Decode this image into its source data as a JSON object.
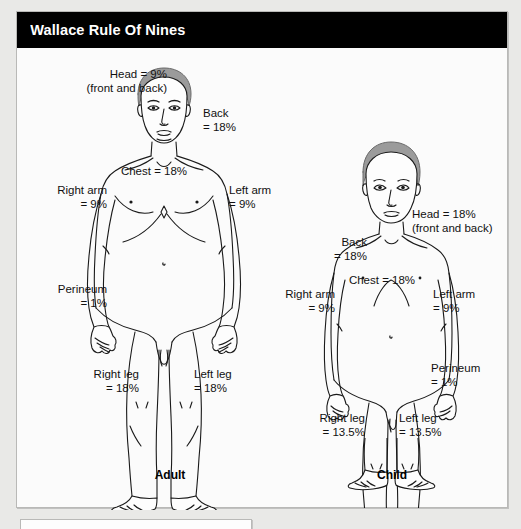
{
  "header": {
    "title": "Wallace Rule Of Nines"
  },
  "figures": {
    "adult": {
      "caption": "Adult",
      "labels": {
        "head": "Head = 9%\n(front and back)",
        "back": "Back\n= 18%",
        "chest": "Chest = 18%",
        "right_arm": "Right arm\n= 9%",
        "left_arm": "Left arm\n= 9%",
        "perineum": "Perineum\n= 1%",
        "right_leg": "Right leg\n= 18%",
        "left_leg": "Left leg\n= 18%"
      }
    },
    "child": {
      "caption": "Child",
      "labels": {
        "head": "Head = 18%\n(front and back)",
        "back": "Back\n= 18%",
        "chest": "Chest = 18%",
        "right_arm": "Right arm\n= 9%",
        "left_arm": "Left arm\n= 9%",
        "perineum": "Perineum\n= 1%",
        "right_leg": "Right leg\n= 13.5%",
        "left_leg": "Left leg\n= 13.5%"
      }
    }
  },
  "colors": {
    "title_bar": "#000000",
    "title_text": "#ffffff",
    "panel_bg": "#fbfbfb",
    "page_bg": "#e9e9e7",
    "border": "#b9b9b7",
    "hair": "#9a9a9a",
    "outline": "#1a1a1a"
  }
}
